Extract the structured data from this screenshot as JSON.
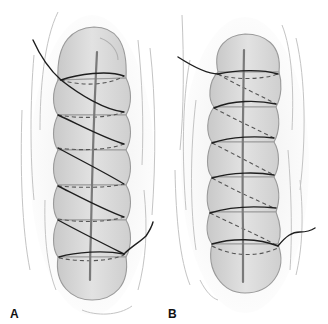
{
  "figure": {
    "panels": [
      {
        "label": "A",
        "technique": "continuous spiral (over-and-over) suture, thread visible crossing diagonally on the front surface",
        "segments": 6
      },
      {
        "label": "B",
        "technique": "continuous suture with horizontal passes visible in front and diagonal returns shown dashed behind",
        "segments": 6
      }
    ]
  },
  "colors": {
    "background": "#ffffff",
    "tissue_fill": "#d6d6d6",
    "tissue_outline": "#9a9a9a",
    "seam": "#7a7a7a",
    "thread": "#1e1e1e",
    "hidden_thread": "#555555",
    "fascia_lines": "#c4c4c4"
  }
}
